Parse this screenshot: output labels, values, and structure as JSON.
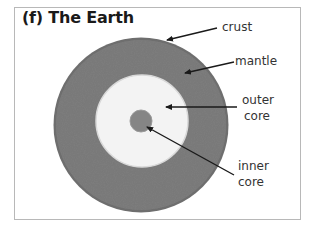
{
  "title": "(f) The Earth",
  "labels": {
    "crust": "crust",
    "mantle": "mantle",
    "outer_core_line1": "outer",
    "outer_core_line2": "core",
    "inner_core_line1": "inner",
    "inner_core_line2": "core"
  },
  "colors": {
    "crust_mantle": "#7a7a7a",
    "outer_core": "#f4f4f4",
    "inner_core": "#808080",
    "arrow": "#1a1a1a",
    "frame": "#b8b8b8"
  }
}
